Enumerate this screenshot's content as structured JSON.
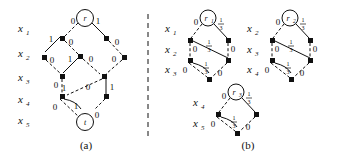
{
  "figure": {
    "caption_a": "(a)",
    "caption_b": "(b)",
    "divider": "vertical-dashed-separator"
  },
  "panel_a": {
    "variables": [
      {
        "name": "x",
        "sub": "1"
      },
      {
        "name": "x",
        "sub": "2"
      },
      {
        "name": "x",
        "sub": "3"
      },
      {
        "name": "x",
        "sub": "4"
      },
      {
        "name": "x",
        "sub": "5"
      }
    ],
    "root": {
      "label": "r"
    },
    "terminal": {
      "label": "t"
    },
    "edge_labels": {
      "r_left": "0",
      "r_right": "1",
      "n11_left": "1",
      "n11_right": "0",
      "n12_right": "0",
      "n21_right": "0",
      "n22_left": "1",
      "n22_right": "0",
      "n23_right": "0",
      "n31_left": "0",
      "n31_right": "1",
      "n32_right": "0",
      "n33_right": "1",
      "n41_left": "0",
      "t_left": "1",
      "n42_right": "0"
    }
  },
  "panel_b": {
    "blocks": [
      {
        "root": {
          "label": "r",
          "sub": "1"
        },
        "variables": [
          {
            "name": "x",
            "sub": "1"
          },
          {
            "name": "x",
            "sub": "2"
          },
          {
            "name": "x",
            "sub": "3"
          }
        ],
        "edge_labels": {
          "root_left": "0",
          "root_right_num": "1",
          "root_right_den": "3",
          "mid_num": "1",
          "mid_den": "3",
          "left_down": "0",
          "right_down": "0",
          "low_left": "0",
          "low_mid_num": "1",
          "low_mid_den": "3",
          "low_right": "0"
        }
      },
      {
        "root": {
          "label": "r",
          "sub": "2"
        },
        "variables": [
          {
            "name": "x",
            "sub": "2"
          },
          {
            "name": "x",
            "sub": "3"
          },
          {
            "name": "x",
            "sub": "4"
          }
        ],
        "edge_labels": {
          "root_left": "0",
          "root_right_num": "1",
          "root_right_den": "3",
          "mid_num": "1",
          "mid_den": "3",
          "left_down": "0",
          "right_down": "0",
          "low_left": "0",
          "low_mid_num": "1",
          "low_mid_den": "3",
          "low_right": "0"
        }
      },
      {
        "root": {
          "label": "r",
          "sub": "3"
        },
        "variables": [
          {
            "name": "x",
            "sub": "4"
          },
          {
            "name": "x",
            "sub": "5"
          }
        ],
        "edge_labels": {
          "root_left": "0",
          "root_right_num": "1",
          "root_right_den": "3",
          "low_left": "0",
          "low_mid_num": "1",
          "low_mid_den": "3",
          "low_right": "0"
        }
      }
    ]
  }
}
